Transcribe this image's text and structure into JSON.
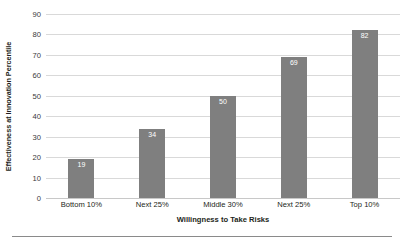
{
  "chart_data": {
    "type": "bar",
    "title": "",
    "categories": [
      "Bottom 10%",
      "Next 25%",
      "Middle 30%",
      "Next 25%",
      "Top 10%"
    ],
    "values": [
      19,
      34,
      50,
      69,
      82
    ],
    "xlabel": "Willingness to Take Risks",
    "ylabel": "Effectiveness at Innovation Percentile",
    "ylim": [
      0,
      90
    ],
    "yticks": [
      90,
      80,
      70,
      60,
      50,
      40,
      30,
      20,
      10,
      0
    ],
    "grid": "horizontal",
    "legend": "none",
    "bar_color": "#7f7f7f",
    "value_label_color": "#ffffff",
    "gridline_color": "#d9d9d9"
  },
  "axes": {
    "y_title": "Effectiveness at Innovation Percentile",
    "x_title": "Willingness to Take Risks"
  }
}
